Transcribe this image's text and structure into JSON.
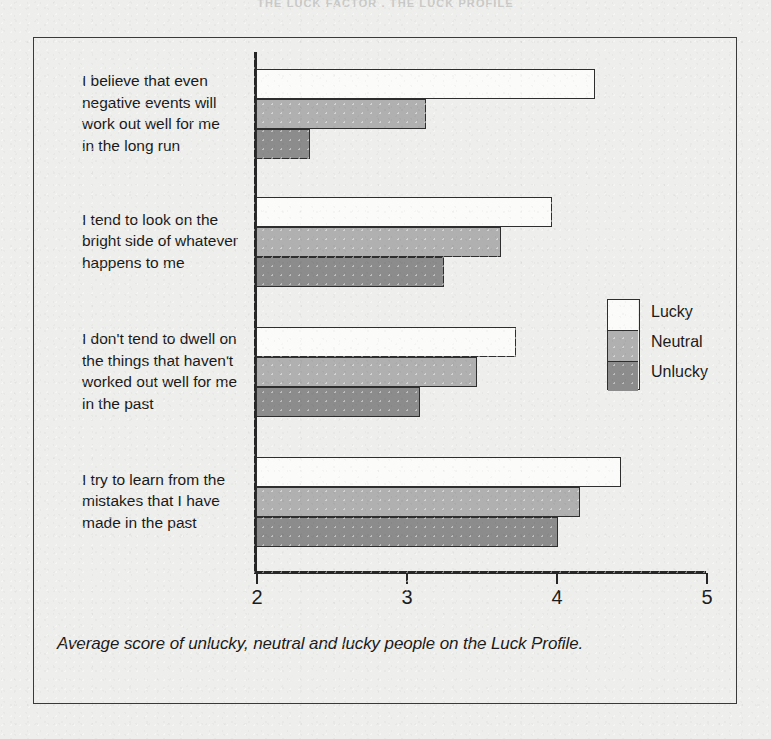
{
  "page": {
    "running_header": "THE LUCK FACTOR  .  THE LUCK PROFILE"
  },
  "figure": {
    "caption": "Average score of unlucky, neutral and lucky people on the Luck Profile."
  },
  "legend": {
    "position": "inside-right",
    "entries": [
      {
        "label": "Lucky",
        "color": "#fbfbfa"
      },
      {
        "label": "Neutral",
        "color": "#b0b0b0"
      },
      {
        "label": "Unlucky",
        "color": "#8c8c8c"
      }
    ]
  },
  "axis": {
    "ticks": [
      "2",
      "3",
      "4",
      "5"
    ]
  },
  "chart_data": {
    "type": "bar",
    "orientation": "horizontal",
    "title": "",
    "subtitle": "",
    "xlabel": "",
    "ylabel": "",
    "xlim": [
      2,
      5
    ],
    "ticks": [
      2,
      3,
      4,
      5
    ],
    "grid": false,
    "legend_position": "inside-right",
    "categories": [
      "I believe that even negative events will work out well for me in the long run",
      "I tend to look on the bright side of whatever happens to me",
      "I don't tend to dwell on the things that haven't worked out well for me in the past",
      "I try to learn from the mistakes that I have made in the past"
    ],
    "category_lines": [
      [
        "I believe that even",
        "negative events will",
        "work out well for me",
        "in the long run"
      ],
      [
        "I tend to look on the",
        "bright side of whatever",
        "happens to me"
      ],
      [
        "I don't tend to dwell on",
        "the things that haven't",
        "worked out well for me",
        "in the past"
      ],
      [
        "I try to learn from the",
        "mistakes that I have",
        "made in the past"
      ]
    ],
    "series": [
      {
        "name": "Lucky",
        "color": "#fbfbfa",
        "values": [
          4.26,
          3.97,
          3.73,
          4.43
        ]
      },
      {
        "name": "Neutral",
        "color": "#b0b0b0",
        "values": [
          3.13,
          3.63,
          3.47,
          4.16
        ]
      },
      {
        "name": "Unlucky",
        "color": "#8c8c8c",
        "values": [
          2.36,
          3.25,
          3.09,
          4.01
        ]
      }
    ]
  }
}
